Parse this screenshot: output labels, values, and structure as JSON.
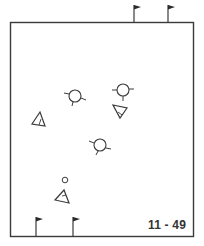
{
  "diagram": {
    "label": "11 - 49",
    "colors": {
      "stroke": "#3a3a3a",
      "background": "#ffffff",
      "flag_fill": "#2a2a2a"
    },
    "field": {
      "x": 10,
      "y": 22,
      "width": 184,
      "height": 215
    },
    "flags": [
      {
        "id": "top-1",
        "x": 134,
        "y_base": 22,
        "y_top": 5
      },
      {
        "id": "top-2",
        "x": 168,
        "y_base": 22,
        "y_top": 5
      },
      {
        "id": "bottom-1",
        "x": 36,
        "y_base": 237,
        "y_top": 217
      },
      {
        "id": "bottom-2",
        "x": 73,
        "y_base": 237,
        "y_top": 217
      }
    ],
    "players_circle": [
      {
        "id": "circle-player-1",
        "cx": 75,
        "cy": 96,
        "r": 6
      },
      {
        "id": "circle-player-2",
        "cx": 123,
        "cy": 90,
        "r": 6
      },
      {
        "id": "circle-player-3",
        "cx": 100,
        "cy": 145,
        "r": 6
      }
    ],
    "players_triangle": [
      {
        "id": "triangle-player-1",
        "points": "40,112 32,124 45,126"
      },
      {
        "id": "triangle-player-2",
        "points": "113,105 127,108 120,118"
      },
      {
        "id": "triangle-player-3",
        "points": "64,190 55,200 69,203"
      }
    ],
    "ball": {
      "cx": 65,
      "cy": 180,
      "r": 3
    }
  }
}
